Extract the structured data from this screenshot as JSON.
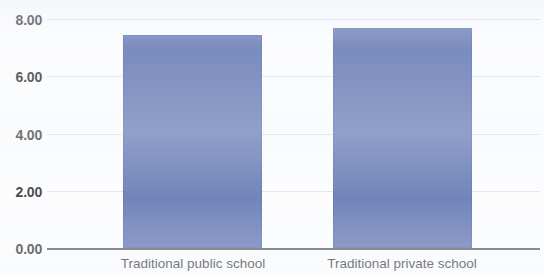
{
  "chart_data": {
    "type": "bar",
    "title": "",
    "subtitle": "",
    "xlabel": "",
    "ylabel": "",
    "categories": [
      "Traditional public school",
      "Traditional private school"
    ],
    "values": [
      7.45,
      7.7
    ],
    "series": [
      {
        "name": "",
        "values": [
          7.45,
          7.7
        ]
      }
    ],
    "ylim": [
      0.0,
      8.0
    ],
    "ytick_labels": [
      "0.00",
      "2.00",
      "4.00",
      "6.00",
      "8.00"
    ],
    "ytick_values": [
      0,
      2,
      4,
      6,
      8
    ],
    "grid": "horizontal",
    "legend": "none",
    "bar_color": "#4f66a9",
    "gridline_color": "#ccd8e4",
    "axis_color": "#4a4a4a",
    "annotations": []
  },
  "axes": {
    "y": {
      "ticks": [
        {
          "label": "8.00",
          "value": 8
        },
        {
          "label": "6.00",
          "value": 6
        },
        {
          "label": "4.00",
          "value": 4
        },
        {
          "label": "2.00",
          "value": 2
        },
        {
          "label": "0.00",
          "value": 0
        }
      ]
    },
    "x": {
      "ticks": [
        {
          "label": "Traditional public school"
        },
        {
          "label": "Traditional private school"
        }
      ]
    }
  }
}
